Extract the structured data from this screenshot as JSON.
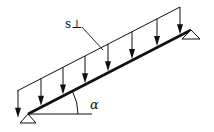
{
  "diagram": {
    "load_label": "s⊥",
    "angle_label": "α",
    "colors": {
      "stroke": "#111111",
      "background": "#ffffff"
    },
    "beam": {
      "start": [
        28,
        114
      ],
      "end": [
        191,
        30
      ],
      "stroke_width": 2.6
    },
    "load_line": {
      "start": [
        17,
        91
      ],
      "end": [
        180,
        7
      ]
    },
    "arrows_x": [
      18,
      41,
      63,
      85,
      108,
      132,
      157,
      180
    ],
    "supports": [
      {
        "name": "left-support",
        "apex": [
          28,
          114
        ],
        "half_width": 8,
        "height": 9
      },
      {
        "name": "right-support",
        "apex": [
          191,
          30
        ],
        "half_width": 9,
        "height": 9
      }
    ],
    "horizontal_ref": {
      "start": [
        28,
        114
      ],
      "end": [
        92,
        114
      ]
    },
    "angle_arc": {
      "center": [
        28,
        114
      ],
      "radius": 50
    },
    "leader": {
      "start": [
        82,
        26
      ],
      "end": [
        103,
        50
      ]
    }
  }
}
